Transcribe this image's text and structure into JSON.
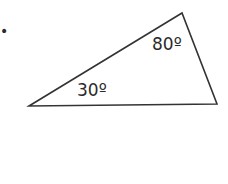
{
  "diagram": {
    "type": "triangle",
    "angles": [
      {
        "vertex": "left",
        "label": "30º"
      },
      {
        "vertex": "top",
        "label": "80º"
      }
    ],
    "stroke_color": "#333333",
    "bullet": "•"
  }
}
